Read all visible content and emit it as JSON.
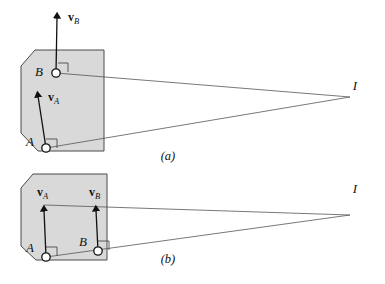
{
  "figure": {
    "background_color": "#ffffff",
    "body_fill_color": "#d9d9d9",
    "body_stroke_color": "#4a4a4a",
    "line_color": "#555555",
    "ink_color": "#111111",
    "width": 385,
    "height": 284
  },
  "panels": [
    {
      "id": "a",
      "caption": "(a)",
      "caption_pos": {
        "x": 168,
        "y": 160
      },
      "body": {
        "name": "rigid-body-octagon",
        "points": "21,66 35,50 104,50 104,151 38,151 21,133"
      },
      "points": [
        {
          "id": "A",
          "label": "A",
          "label_pos": {
            "x": 30,
            "y": 146
          },
          "marker": {
            "cx": 46,
            "cy": 148,
            "r": 4.2
          },
          "right_angle": "46,139 57,139 57,148"
        },
        {
          "id": "B",
          "label": "B",
          "label_pos": {
            "x": 39,
            "y": 76
          },
          "marker": {
            "cx": 56,
            "cy": 73,
            "r": 4.2
          },
          "right_angle": "58,63 68,63 68,72"
        }
      ],
      "vectors": [
        {
          "id": "vA",
          "symbol": "v",
          "subscript": "A",
          "label_pos": {
            "x": 48,
            "y": 101
          },
          "tail": {
            "x": 46,
            "y": 148
          },
          "tip": {
            "x": 37,
            "y": 91
          }
        },
        {
          "id": "vB",
          "symbol": "v",
          "subscript": "B",
          "label_pos": {
            "x": 68,
            "y": 21
          },
          "tail": {
            "x": 56,
            "y": 73
          },
          "tip": {
            "x": 57,
            "y": 12
          }
        }
      ],
      "center": {
        "id": "I",
        "label": "I",
        "label_pos": {
          "x": 355,
          "y": 90
        },
        "point": {
          "x": 350,
          "y": 97
        }
      },
      "construction_lines": [
        {
          "from": "A",
          "x1": 46,
          "y1": 148,
          "x2": 350,
          "y2": 97
        },
        {
          "from": "B",
          "x1": 56,
          "y1": 73,
          "x2": 350,
          "y2": 97
        }
      ]
    },
    {
      "id": "b",
      "caption": "(b)",
      "caption_pos": {
        "x": 168,
        "y": 263
      },
      "body": {
        "name": "rigid-body-octagon",
        "points": "21,188 33,174 107,174 107,260 36,260 21,246"
      },
      "points": [
        {
          "id": "A",
          "label": "A",
          "label_pos": {
            "x": 28,
            "y": 245
          },
          "marker": {
            "cx": 46,
            "cy": 257,
            "r": 4.2
          },
          "right_angle": "46,247 57,247 57,256"
        },
        {
          "id": "B",
          "label": "B",
          "label_pos": {
            "x": 81,
            "y": 240
          },
          "marker": {
            "cx": 98,
            "cy": 251,
            "r": 4.2
          },
          "right_angle": "98,241 109,241 109,250"
        }
      ],
      "vectors": [
        {
          "id": "vA",
          "symbol": "v",
          "subscript": "A",
          "label_pos": {
            "x": 37,
            "y": 195
          },
          "tail": {
            "x": 46,
            "y": 257
          },
          "tip": {
            "x": 44,
            "y": 205
          }
        },
        {
          "id": "vB",
          "symbol": "v",
          "subscript": "B",
          "label_pos": {
            "x": 89,
            "y": 195
          },
          "tail": {
            "x": 98,
            "y": 251
          },
          "tip": {
            "x": 96,
            "y": 205
          }
        }
      ],
      "center": {
        "id": "I",
        "label": "I",
        "label_pos": {
          "x": 355,
          "y": 193
        },
        "point": {
          "x": 350,
          "y": 215
        }
      },
      "construction_lines": [
        {
          "from": "A",
          "x1": 46,
          "y1": 257,
          "x2": 350,
          "y2": 215
        },
        {
          "from": "B",
          "x1": 44,
          "y1": 205,
          "x2": 350,
          "y2": 215
        }
      ]
    }
  ]
}
